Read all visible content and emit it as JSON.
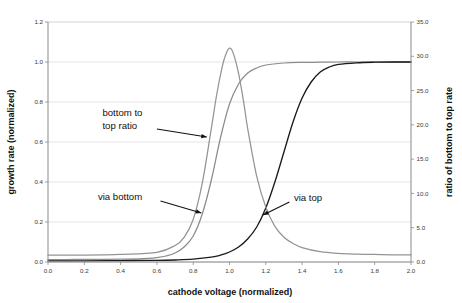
{
  "chart_data": {
    "type": "line",
    "title": "",
    "xlabel": "cathode voltage (normalized)",
    "ylabel": "growth rate (normalized)",
    "y2label": "ratio of bottom to top rate",
    "xlim": [
      0.0,
      2.0
    ],
    "ylim": [
      0.0,
      1.2
    ],
    "y2lim": [
      0.0,
      35.0
    ],
    "grid": true,
    "legend_position": "none",
    "xticks": [
      "0.0",
      "0.2",
      "0.4",
      "0.6",
      "0.8",
      "1.0",
      "1.2",
      "1.4",
      "1.6",
      "1.8",
      "2.0"
    ],
    "yticks": [
      "0.0",
      "0.2",
      "0.4",
      "0.6",
      "0.8",
      "1.0",
      "1.2"
    ],
    "y2ticks": [
      "0.0",
      "5.0",
      "10.0",
      "15.0",
      "20.0",
      "25.0",
      "30.0",
      "35.0"
    ],
    "series": [
      {
        "name": "via bottom",
        "axis": "left",
        "color": "#8c8c8c",
        "x": [
          0.0,
          0.1,
          0.2,
          0.3,
          0.4,
          0.5,
          0.55,
          0.6,
          0.65,
          0.7,
          0.75,
          0.8,
          0.85,
          0.9,
          0.95,
          1.0,
          1.05,
          1.1,
          1.15,
          1.2,
          1.3,
          1.4,
          1.5,
          1.6,
          1.7,
          1.8,
          1.9,
          2.0
        ],
        "values": [
          0.012,
          0.012,
          0.013,
          0.013,
          0.014,
          0.016,
          0.018,
          0.022,
          0.03,
          0.045,
          0.075,
          0.13,
          0.24,
          0.41,
          0.62,
          0.79,
          0.89,
          0.945,
          0.97,
          0.985,
          0.995,
          0.998,
          0.999,
          1.0,
          1.0,
          1.0,
          1.0,
          1.0
        ]
      },
      {
        "name": "via top",
        "axis": "left",
        "color": "#1a1a1a",
        "x": [
          0.0,
          0.2,
          0.4,
          0.6,
          0.7,
          0.8,
          0.9,
          0.95,
          1.0,
          1.05,
          1.1,
          1.15,
          1.2,
          1.25,
          1.3,
          1.35,
          1.4,
          1.45,
          1.5,
          1.55,
          1.6,
          1.7,
          1.8,
          1.9,
          2.0
        ],
        "values": [
          0.006,
          0.006,
          0.007,
          0.008,
          0.01,
          0.014,
          0.024,
          0.034,
          0.05,
          0.075,
          0.115,
          0.175,
          0.27,
          0.4,
          0.55,
          0.7,
          0.82,
          0.9,
          0.95,
          0.975,
          0.988,
          0.996,
          0.999,
          1.0,
          1.0
        ]
      },
      {
        "name": "bottom to top ratio",
        "axis": "right",
        "color": "#949494",
        "x": [
          0.0,
          0.2,
          0.4,
          0.6,
          0.7,
          0.75,
          0.8,
          0.85,
          0.9,
          0.93,
          0.96,
          0.98,
          1.0,
          1.02,
          1.05,
          1.08,
          1.1,
          1.15,
          1.2,
          1.25,
          1.3,
          1.35,
          1.4,
          1.5,
          1.6,
          1.7,
          1.8,
          1.9,
          2.0
        ],
        "values": [
          1.0,
          1.0,
          1.1,
          1.4,
          2.4,
          3.6,
          6.2,
          11.5,
          19.5,
          24.5,
          28.5,
          30.3,
          31.2,
          30.5,
          27.5,
          23.0,
          19.5,
          12.5,
          8.0,
          5.2,
          3.6,
          2.7,
          2.1,
          1.5,
          1.25,
          1.15,
          1.1,
          1.05,
          1.05
        ]
      }
    ],
    "annotations": [
      {
        "id": "annot-ratio",
        "text_lines": [
          "bottom to",
          "top ratio"
        ],
        "text_x": 0.3,
        "text_y_left": 0.73,
        "arrow_from": [
          0.6,
          0.665
        ],
        "arrow_to": [
          0.875,
          0.625
        ]
      },
      {
        "id": "annot-via-bottom",
        "text_lines": [
          "via bottom"
        ],
        "text_x": 0.275,
        "text_y_left": 0.31,
        "arrow_from": [
          0.62,
          0.305
        ],
        "arrow_to": [
          0.845,
          0.245
        ]
      },
      {
        "id": "annot-via-top",
        "text_lines": [
          "via top"
        ],
        "text_x": 1.355,
        "text_y_left": 0.305,
        "arrow_from": [
          1.33,
          0.3
        ],
        "arrow_to": [
          1.185,
          0.235
        ]
      }
    ]
  }
}
